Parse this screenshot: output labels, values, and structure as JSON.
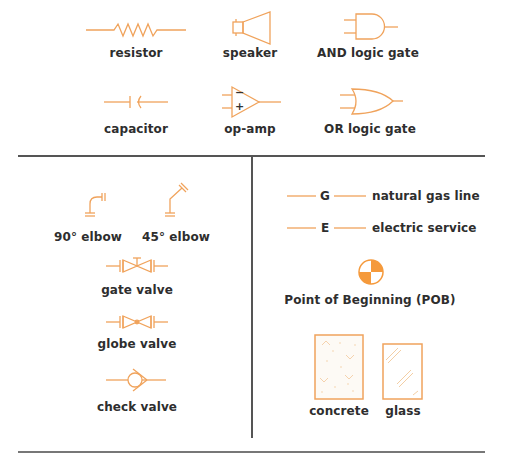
{
  "colors": {
    "symbol": "#f0a35c",
    "fill": "#f59a3c",
    "text": "#2e2e2e",
    "rule": "#555555"
  },
  "top_section": {
    "symbols": [
      {
        "id": "resistor",
        "label": "resistor",
        "icon": "resistor-icon"
      },
      {
        "id": "speaker",
        "label": "speaker",
        "icon": "speaker-icon"
      },
      {
        "id": "and-gate",
        "label": "AND logic gate",
        "icon": "and-gate-icon"
      },
      {
        "id": "capacitor",
        "label": "capacitor",
        "icon": "capacitor-icon"
      },
      {
        "id": "op-amp",
        "label": "op-amp",
        "icon": "op-amp-icon",
        "inputs": [
          "−",
          "+"
        ]
      },
      {
        "id": "or-gate",
        "label": "OR logic gate",
        "icon": "or-gate-icon"
      }
    ]
  },
  "plumbing_section": {
    "symbols": [
      {
        "id": "elbow-90",
        "label": "90° elbow",
        "icon": "elbow-90-icon"
      },
      {
        "id": "elbow-45",
        "label": "45° elbow",
        "icon": "elbow-45-icon"
      },
      {
        "id": "gate-valve",
        "label": "gate valve",
        "icon": "gate-valve-icon"
      },
      {
        "id": "globe-valve",
        "label": "globe valve",
        "icon": "globe-valve-icon"
      },
      {
        "id": "check-valve",
        "label": "check valve",
        "icon": "check-valve-icon"
      }
    ]
  },
  "site_section": {
    "lines": [
      {
        "id": "gas",
        "letter": "G",
        "label": "natural gas line"
      },
      {
        "id": "electric",
        "letter": "E",
        "label": "electric service"
      }
    ],
    "pob": {
      "label": "Point of Beginning (POB)",
      "icon": "pob-icon"
    },
    "materials": [
      {
        "id": "concrete",
        "label": "concrete",
        "icon": "concrete-hatch-icon"
      },
      {
        "id": "glass",
        "label": "glass",
        "icon": "glass-hatch-icon"
      }
    ]
  }
}
